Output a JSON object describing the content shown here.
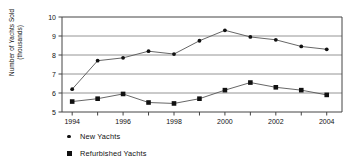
{
  "chart_data": {
    "type": "line",
    "title": "",
    "xlabel": "",
    "ylabel": "Number of Yachts Sold\n(thousands)",
    "x": [
      1994,
      1995,
      1996,
      1997,
      1998,
      1999,
      2000,
      2001,
      2002,
      2003,
      2004
    ],
    "xtick_labels": [
      "1994",
      "",
      "1996",
      "",
      "1998",
      "",
      "2000",
      "",
      "2002",
      "",
      "2004"
    ],
    "xlim": [
      1993.6,
      2004.6
    ],
    "ylim": [
      5,
      10
    ],
    "ytick_labels": [
      "5",
      "6",
      "7",
      "8",
      "9",
      "10"
    ],
    "yticks": [
      5,
      6,
      7,
      8,
      9,
      10
    ],
    "grid": "horizontal",
    "legend_position": "below-left",
    "series": [
      {
        "name": "New Yachts",
        "marker": "circle",
        "values": [
          6.2,
          7.7,
          7.85,
          8.2,
          8.05,
          8.75,
          9.3,
          8.95,
          8.8,
          8.45,
          8.3
        ]
      },
      {
        "name": "Refurbished Yachts",
        "marker": "square",
        "values": [
          5.55,
          5.7,
          5.95,
          5.5,
          5.45,
          5.7,
          6.15,
          6.55,
          6.3,
          6.15,
          5.9
        ]
      }
    ],
    "colors": {
      "line": "#555555",
      "marker": "#111111",
      "grid": "#888888",
      "axis": "#444444"
    }
  }
}
